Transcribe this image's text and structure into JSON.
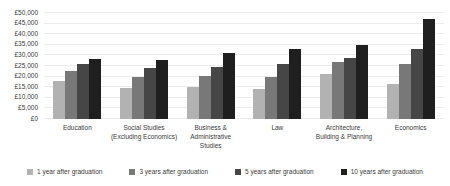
{
  "chart_data": {
    "type": "bar",
    "title": "",
    "xlabel": "",
    "ylabel": "",
    "categories": [
      "Education",
      "Social Studies (Excluding Economics)",
      "Business & Administrative Studies",
      "Law",
      "Architecture, Building & Planning",
      "Economics"
    ],
    "category_labels_display": [
      "Education",
      "Social Studies\n(Excluding Economics)",
      "Business &\nAdministrative\nStudies",
      "Law",
      "Architecture,\nBuilding & Planning",
      "Economics"
    ],
    "series": [
      {
        "name": "1 year after graduation",
        "color": "#b2b2b2",
        "values": [
          18000,
          14500,
          15000,
          14000,
          21000,
          16500
        ]
      },
      {
        "name": "3 years after graduation",
        "color": "#787878",
        "values": [
          22500,
          20000,
          20500,
          20000,
          27000,
          26000
        ]
      },
      {
        "name": "5 years after graduation",
        "color": "#464646",
        "values": [
          26000,
          24000,
          24500,
          26000,
          29000,
          33000
        ]
      },
      {
        "name": "10 years after graduation",
        "color": "#1f1f1f",
        "values": [
          28500,
          28000,
          31000,
          33000,
          35000,
          47000
        ]
      }
    ],
    "ylim": [
      0,
      50000
    ],
    "ytick_step": 5000,
    "ytick_labels": [
      "£0",
      "£5,000",
      "£10,000",
      "£15,000",
      "£20,000",
      "£25,000",
      "£30,000",
      "£35,000",
      "£40,000",
      "£45,000",
      "£50,000"
    ],
    "grid": true,
    "legend_position": "bottom",
    "background_color": "#ffffff",
    "gridline_color": "#ececec",
    "text_color": "#3b3b3b"
  }
}
